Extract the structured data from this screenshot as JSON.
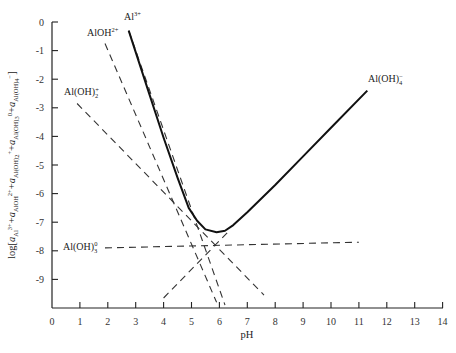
{
  "chart_data": {
    "type": "line",
    "title": "",
    "xlabel": "pH",
    "ylabel": "log[a_Al3+ + a_AlOH2+ + a_Al(OH)2+ + a_Al(OH)3^0 + a_Al(OH)4-]",
    "xlim": [
      0,
      14
    ],
    "ylim": [
      -10,
      0
    ],
    "x_ticks": [
      0,
      1,
      2,
      3,
      4,
      5,
      6,
      7,
      8,
      9,
      10,
      11,
      12,
      13,
      14
    ],
    "y_ticks": [
      0,
      -1,
      -2,
      -3,
      -4,
      -5,
      -6,
      -7,
      -8,
      -9
    ],
    "grid": false,
    "legend": "inline labels",
    "series": [
      {
        "name": "Al3+",
        "label": "Al",
        "label_sup": "3+",
        "style": "dashed",
        "slope": -3,
        "points": [
          [
            2.75,
            -0.3
          ],
          [
            6.2,
            -9.9
          ]
        ]
      },
      {
        "name": "AlOH2+",
        "label": "AlOH",
        "label_sup": "2+",
        "style": "dashed",
        "slope": -2,
        "points": [
          [
            1.9,
            -0.75
          ],
          [
            5.9,
            -9.8
          ]
        ]
      },
      {
        "name": "Al(OH)2+",
        "label": "Al(OH)",
        "label_sub": "2",
        "label_sup": "+",
        "style": "dashed",
        "slope": -1,
        "points": [
          [
            0.9,
            -2.85
          ],
          [
            7.6,
            -9.55
          ]
        ]
      },
      {
        "name": "Al(OH)3^0",
        "label": "Al(OH)",
        "label_sub": "3",
        "label_sup": "0",
        "style": "dashed",
        "slope": 0,
        "points": [
          [
            1.9,
            -7.9
          ],
          [
            11.0,
            -7.7
          ]
        ]
      },
      {
        "name": "Al(OH)4-",
        "label": "Al(OH)",
        "label_sub": "4",
        "label_sup": "−",
        "style": "dashed then solid",
        "slope": 1,
        "points": [
          [
            4.0,
            -9.65
          ],
          [
            6.3,
            -7.35
          ],
          [
            11.3,
            -2.4
          ]
        ]
      },
      {
        "name": "Total dissolved Al",
        "style": "solid",
        "points": [
          [
            2.75,
            -0.3
          ],
          [
            3.5,
            -2.55
          ],
          [
            4.0,
            -4.05
          ],
          [
            4.5,
            -5.45
          ],
          [
            4.9,
            -6.5
          ],
          [
            5.2,
            -6.95
          ],
          [
            5.5,
            -7.25
          ],
          [
            5.9,
            -7.35
          ],
          [
            6.2,
            -7.3
          ],
          [
            6.5,
            -7.1
          ],
          [
            7.0,
            -6.65
          ],
          [
            8.0,
            -5.7
          ],
          [
            9.0,
            -4.7
          ],
          [
            10.0,
            -3.7
          ],
          [
            11.3,
            -2.4
          ]
        ]
      }
    ],
    "minimum_solubility": {
      "pH": 5.9,
      "log": -7.35
    }
  },
  "labels": {
    "x_axis_title": "pH",
    "y_axis_title_prefix": "log[",
    "y_axis_title_suffix": "]",
    "al3": {
      "base": "Al",
      "sup": "3+"
    },
    "aloh": {
      "base": "AlOH",
      "sup": "2+"
    },
    "aloh2": {
      "base": "Al(OH)",
      "sub": "2",
      "sup": "+"
    },
    "aloh3": {
      "base": "Al(OH)",
      "sub": "3",
      "sup": "0"
    },
    "aloh4": {
      "base": "Al(OH)",
      "sub": "4",
      "sup": "−"
    }
  },
  "x_tick_labels": [
    "0",
    "1",
    "2",
    "3",
    "4",
    "5",
    "6",
    "7",
    "8",
    "9",
    "10",
    "11",
    "12",
    "13",
    "14"
  ],
  "y_tick_labels": [
    "0",
    "-1",
    "-2",
    "-3",
    "-4",
    "-5",
    "-6",
    "-7",
    "-8",
    "-9"
  ]
}
